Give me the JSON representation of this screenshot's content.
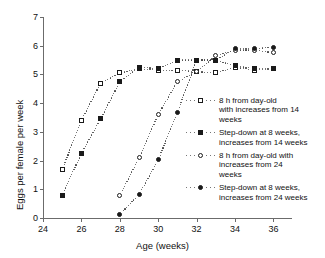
{
  "chart_data": {
    "type": "line",
    "title": "",
    "xlabel": "Age (weeks)",
    "ylabel": "Eggs per female per week",
    "xlim": [
      24,
      37
    ],
    "ylim": [
      0,
      7
    ],
    "xticks": [
      24,
      26,
      28,
      30,
      32,
      34,
      36
    ],
    "yticks": [
      0,
      1,
      2,
      3,
      4,
      5,
      6,
      7
    ],
    "grid": false,
    "legend_position": "right-inside",
    "linestyle": "dotted",
    "series": [
      {
        "name": "8 h from day-old with increases from 14 weeks",
        "marker": "open-square",
        "x": [
          25,
          26,
          27,
          28,
          29,
          30,
          31,
          32,
          33,
          34,
          35,
          36
        ],
        "values": [
          1.68,
          3.4,
          4.7,
          5.05,
          5.2,
          5.15,
          5.15,
          5.1,
          5.05,
          5.25,
          5.15,
          5.2
        ]
      },
      {
        "name": "Step-down at 8 weeks, increases from 14 weeks",
        "marker": "filled-square",
        "x": [
          25,
          26,
          27,
          28,
          29,
          30,
          31,
          32,
          33,
          34,
          35,
          36
        ],
        "values": [
          0.8,
          2.25,
          3.45,
          4.75,
          5.25,
          5.2,
          5.5,
          5.5,
          5.5,
          5.3,
          5.2,
          5.2
        ]
      },
      {
        "name": "8 h from day-old with increases from 24 weeks",
        "marker": "open-circle",
        "x": [
          28,
          29,
          30,
          31,
          32,
          33,
          34,
          35,
          36
        ],
        "values": [
          0.78,
          2.1,
          3.6,
          4.75,
          5.1,
          5.65,
          5.85,
          5.85,
          5.75
        ]
      },
      {
        "name": "Step-down at 8 weeks, increases from 24 weeks",
        "marker": "filled-circle",
        "x": [
          28,
          29,
          30,
          31,
          32,
          33,
          34,
          35,
          36
        ],
        "values": [
          0.12,
          0.82,
          2.02,
          3.68,
          5.5,
          5.5,
          5.9,
          5.9,
          5.95
        ]
      }
    ],
    "legend": [
      {
        "marker": "open-square",
        "label": "8 h from day-old\nwith increases from 14\nweeks"
      },
      {
        "marker": "filled-square",
        "label": "Step-down at 8 weeks,\nincreases from 14 weeks"
      },
      {
        "marker": "open-circle",
        "label": "8 h from day-old with\nincreases from 24\nweeks"
      },
      {
        "marker": "filled-circle",
        "label": "Step-down at 8 weeks,\nincreases from 24 weeks"
      }
    ]
  },
  "colors": {
    "ink": "#1a1a1a",
    "axis": "#6b6b6b",
    "line": "#4a4a4a",
    "background": "#ffffff"
  }
}
